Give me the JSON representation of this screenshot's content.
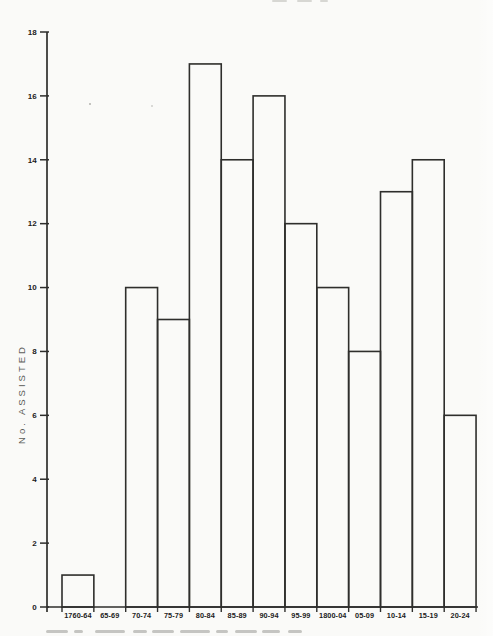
{
  "page": {
    "background": "#fafaf8",
    "ink": "#2e2e2c",
    "label_color": "#1c1c1c",
    "axis_title_color": "#5c5c58"
  },
  "chart_data": {
    "type": "bar",
    "subtype": "outlined-unfilled-contiguous-histogram",
    "title": "",
    "xlabel": "",
    "ylabel": "No. ASSISTED",
    "categories": [
      "1760-64",
      "65-69",
      "70-74",
      "75-79",
      "80-84",
      "85-89",
      "90-94",
      "95-99",
      "1800-04",
      "05-09",
      "10-14",
      "15-19",
      "20-24"
    ],
    "values": [
      1,
      0,
      10,
      9,
      17,
      14,
      16,
      12,
      10,
      8,
      13,
      14,
      6
    ],
    "ylim": [
      0,
      18
    ],
    "ytick_step": 2,
    "ytick_labels": [
      "0",
      "2",
      "4",
      "6",
      "8",
      "10",
      "12",
      "14",
      "16",
      "18"
    ],
    "grid": false,
    "legend": "none",
    "bars_filled": false
  }
}
